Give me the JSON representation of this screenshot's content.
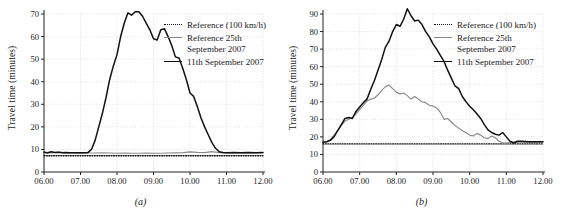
{
  "figure": {
    "panels": [
      {
        "id": "a",
        "caption": "(a)",
        "ylabel": "Travel time (minutes)",
        "legend": [
          {
            "key": "dotted",
            "label": "Reference (100 km/h)"
          },
          {
            "key": "gray",
            "label": "Reference 25th\nSeptember 2007"
          },
          {
            "key": "black",
            "label": "11th September 2007"
          }
        ]
      },
      {
        "id": "b",
        "caption": "(b)",
        "ylabel": "Travel time (minutes)",
        "legend": [
          {
            "key": "dotted",
            "label": "Reference (100 km/h)"
          },
          {
            "key": "gray",
            "label": "Reference 25th\nSeptember 2007"
          },
          {
            "key": "black",
            "label": "11th September 2007"
          }
        ]
      }
    ]
  },
  "colors": {
    "incident_line": "#111111",
    "reference_day_line": "#8a8a8a",
    "reference_speed_line": "#111111",
    "grid": "#cfcfcf",
    "axis": "#222222",
    "background": "#ffffff"
  },
  "chart_data": [
    {
      "type": "line",
      "panel": "a",
      "title": "",
      "xlabel": "",
      "ylabel": "Travel time (minutes)",
      "xlim": [
        6.0,
        12.0
      ],
      "ylim": [
        0,
        70
      ],
      "yticks": [
        0,
        10,
        20,
        30,
        40,
        50,
        60,
        70
      ],
      "xticks": [
        6,
        7,
        8,
        9,
        10,
        11,
        12
      ],
      "xticklabels": [
        "06.00",
        "07.00",
        "08.00",
        "09.00",
        "10.00",
        "11.00",
        "12.00"
      ],
      "grid": true,
      "legend_position": "upper-right",
      "series": [
        {
          "name": "Reference (100 km/h)",
          "style": "dotted",
          "color": "#111111",
          "x": [
            6.0,
            12.0
          ],
          "values": [
            7.2,
            7.2
          ]
        },
        {
          "name": "Reference 25th September 2007",
          "style": "solid-gray",
          "color": "#8a8a8a",
          "x": [
            6.0,
            6.2,
            6.4,
            6.6,
            6.8,
            7.0,
            7.2,
            7.4,
            7.6,
            7.8,
            8.0,
            8.2,
            8.4,
            8.6,
            8.8,
            9.0,
            9.2,
            9.4,
            9.6,
            9.8,
            10.0,
            10.2,
            10.4,
            10.6,
            10.8,
            11.0,
            11.2,
            11.4,
            11.6,
            11.8,
            12.0
          ],
          "values": [
            8.6,
            8.4,
            8.8,
            8.5,
            8.4,
            8.3,
            8.4,
            8.4,
            8.5,
            8.4,
            8.3,
            8.4,
            8.3,
            8.3,
            8.4,
            8.3,
            8.3,
            8.4,
            8.5,
            8.6,
            8.9,
            8.7,
            8.6,
            9.0,
            8.6,
            8.4,
            8.4,
            8.5,
            8.4,
            8.4,
            8.5
          ]
        },
        {
          "name": "11th September 2007",
          "style": "solid-black",
          "color": "#111111",
          "x": [
            6.0,
            6.1,
            6.2,
            6.3,
            6.4,
            6.5,
            6.6,
            6.7,
            6.8,
            6.9,
            7.0,
            7.1,
            7.2,
            7.3,
            7.4,
            7.5,
            7.6,
            7.7,
            7.8,
            7.9,
            8.0,
            8.1,
            8.2,
            8.3,
            8.4,
            8.5,
            8.6,
            8.7,
            8.8,
            8.9,
            9.0,
            9.1,
            9.2,
            9.3,
            9.4,
            9.5,
            9.6,
            9.7,
            9.8,
            9.9,
            10.0,
            10.1,
            10.2,
            10.3,
            10.4,
            10.5,
            10.6,
            10.7,
            10.8,
            10.9,
            11.0,
            11.2,
            11.4,
            11.6,
            11.8,
            12.0
          ],
          "values": [
            8.8,
            8.5,
            9.0,
            8.6,
            8.7,
            8.5,
            8.6,
            8.5,
            8.5,
            8.5,
            8.5,
            8.5,
            8.6,
            10.0,
            14.0,
            20.0,
            26.0,
            33.0,
            41.0,
            47.0,
            52.0,
            60.0,
            66.0,
            70.5,
            69.5,
            71.0,
            71.0,
            69.0,
            66.0,
            63.0,
            59.0,
            58.5,
            63.0,
            63.5,
            60.0,
            56.0,
            51.0,
            50.5,
            46.0,
            41.0,
            35.0,
            33.5,
            29.0,
            24.0,
            20.0,
            16.5,
            13.0,
            10.5,
            9.0,
            8.6,
            8.5,
            8.6,
            8.5,
            8.6,
            8.5,
            8.6
          ]
        }
      ]
    },
    {
      "type": "line",
      "panel": "b",
      "title": "",
      "xlabel": "",
      "ylabel": "Travel time (minutes)",
      "xlim": [
        6.0,
        12.0
      ],
      "ylim": [
        0,
        90
      ],
      "yticks": [
        0,
        10,
        20,
        30,
        40,
        50,
        60,
        70,
        80,
        90
      ],
      "xticks": [
        6,
        7,
        8,
        9,
        10,
        11,
        12
      ],
      "xticklabels": [
        "06.00",
        "07.00",
        "08.00",
        "09.00",
        "10.00",
        "11.00",
        "12.00"
      ],
      "grid": true,
      "legend_position": "upper-right",
      "series": [
        {
          "name": "Reference (100 km/h)",
          "style": "dotted",
          "color": "#111111",
          "x": [
            6.0,
            12.0
          ],
          "values": [
            16.0,
            16.0
          ]
        },
        {
          "name": "Reference 25th September 2007",
          "style": "solid-gray",
          "color": "#8a8a8a",
          "x": [
            6.0,
            6.1,
            6.2,
            6.3,
            6.4,
            6.5,
            6.6,
            6.7,
            6.8,
            6.9,
            7.0,
            7.1,
            7.2,
            7.3,
            7.4,
            7.5,
            7.6,
            7.7,
            7.8,
            7.9,
            8.0,
            8.1,
            8.2,
            8.3,
            8.4,
            8.5,
            8.6,
            8.7,
            8.8,
            8.9,
            9.0,
            9.1,
            9.2,
            9.3,
            9.4,
            9.5,
            9.6,
            9.7,
            9.8,
            9.9,
            10.0,
            10.1,
            10.2,
            10.3,
            10.4,
            10.5,
            10.6,
            10.7,
            10.8,
            10.9,
            11.0,
            11.2,
            11.4,
            11.6,
            11.8,
            12.0
          ],
          "values": [
            17.0,
            17.2,
            18.5,
            21.0,
            23.5,
            26.5,
            29.0,
            30.0,
            31.0,
            33.0,
            35.5,
            38.0,
            40.5,
            41.5,
            42.0,
            44.0,
            46.5,
            48.5,
            49.5,
            47.5,
            45.5,
            44.5,
            45.0,
            43.5,
            41.5,
            43.0,
            41.5,
            40.0,
            39.5,
            38.0,
            37.5,
            36.5,
            34.0,
            30.0,
            30.5,
            28.5,
            26.5,
            25.0,
            23.5,
            22.5,
            21.0,
            20.5,
            22.0,
            21.0,
            19.5,
            19.0,
            20.5,
            19.5,
            17.5,
            16.5,
            16.5,
            17.0,
            17.0,
            17.0,
            17.0,
            17.0
          ]
        },
        {
          "name": "11th September 2007",
          "style": "solid-black",
          "color": "#111111",
          "x": [
            6.0,
            6.1,
            6.2,
            6.3,
            6.4,
            6.5,
            6.6,
            6.7,
            6.8,
            6.9,
            7.0,
            7.1,
            7.2,
            7.3,
            7.4,
            7.5,
            7.6,
            7.7,
            7.8,
            7.9,
            8.0,
            8.1,
            8.2,
            8.3,
            8.4,
            8.5,
            8.6,
            8.7,
            8.8,
            8.9,
            9.0,
            9.1,
            9.2,
            9.3,
            9.4,
            9.5,
            9.6,
            9.7,
            9.8,
            9.9,
            10.0,
            10.1,
            10.2,
            10.3,
            10.4,
            10.5,
            10.6,
            10.7,
            10.8,
            10.9,
            11.0,
            11.1,
            11.2,
            11.3,
            11.4,
            11.6,
            11.8,
            12.0
          ],
          "values": [
            17.0,
            17.2,
            18.0,
            20.0,
            23.5,
            27.0,
            30.5,
            31.0,
            30.5,
            34.5,
            37.0,
            39.5,
            41.5,
            47.0,
            52.0,
            58.0,
            64.0,
            71.0,
            74.5,
            80.0,
            84.0,
            83.0,
            87.0,
            93.0,
            89.0,
            86.0,
            86.5,
            84.0,
            80.0,
            77.0,
            73.0,
            70.0,
            66.5,
            63.0,
            58.0,
            53.5,
            49.0,
            47.5,
            43.0,
            40.0,
            37.5,
            35.5,
            33.0,
            30.5,
            27.0,
            24.0,
            22.5,
            21.5,
            21.0,
            22.5,
            20.0,
            17.5,
            16.5,
            17.5,
            17.5,
            17.2,
            17.2,
            17.2
          ]
        }
      ]
    }
  ]
}
